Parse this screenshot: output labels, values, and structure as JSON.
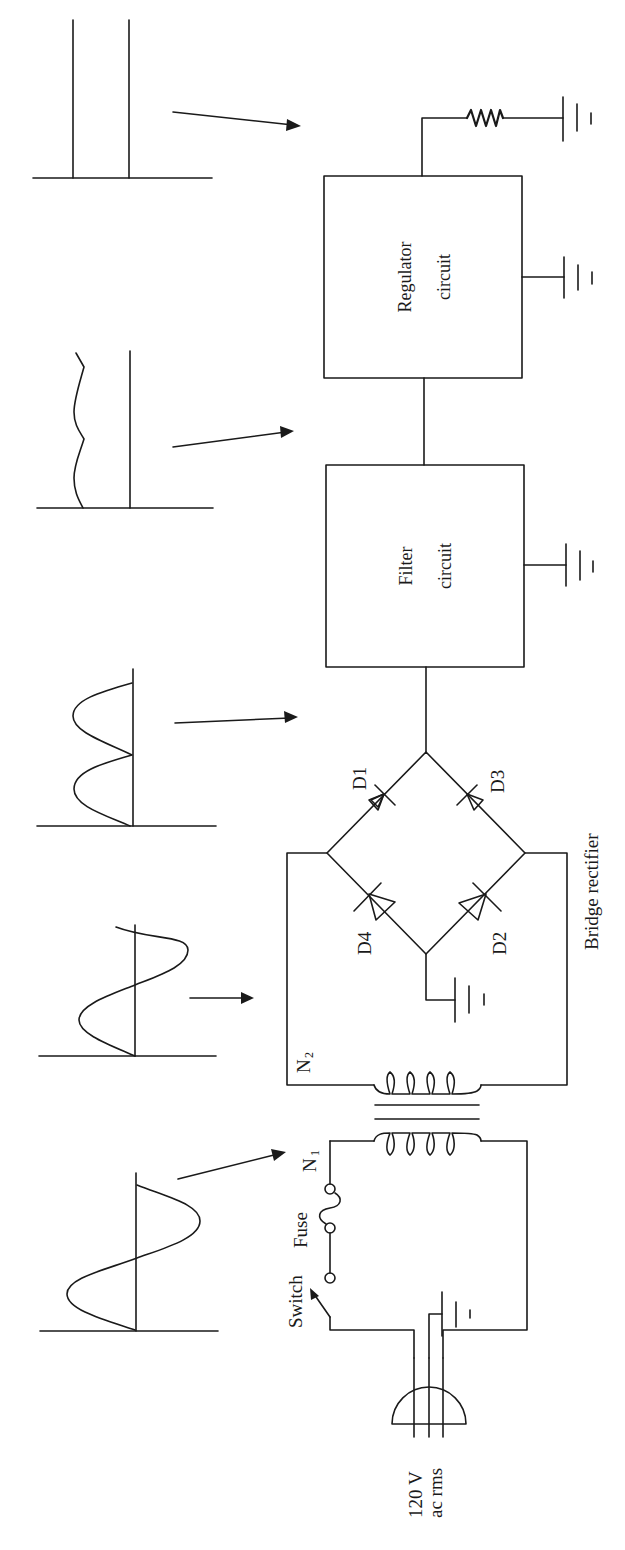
{
  "figure": {
    "orientation": "rotated 90 degrees counter-clockwise",
    "stroke_color": "#1a1a1a",
    "background": "#ffffff"
  },
  "source": {
    "line1": "120 V",
    "line2": "ac rms",
    "icon": "ac-plug-icon"
  },
  "controls": {
    "switch_label": "Switch",
    "fuse_label": "Fuse"
  },
  "transformer": {
    "primary_label": "N",
    "primary_sub": "1",
    "secondary_label": "N",
    "secondary_sub": "2"
  },
  "rectifier": {
    "title": "Bridge rectifier",
    "diodes": [
      {
        "id": "D1"
      },
      {
        "id": "D2"
      },
      {
        "id": "D3"
      },
      {
        "id": "D4"
      }
    ]
  },
  "blocks": [
    {
      "id": "filter",
      "line1": "Filter",
      "line2": "circuit"
    },
    {
      "id": "regulator",
      "line1": "Regulator",
      "line2": "circuit"
    }
  ],
  "load": {
    "icon": "resistor-icon"
  },
  "waveforms": [
    {
      "stage": "transformer-primary",
      "shape": "sine (large amplitude)"
    },
    {
      "stage": "transformer-secondary",
      "shape": "sine (reduced amplitude)"
    },
    {
      "stage": "rectifier-output",
      "shape": "full-wave rectified"
    },
    {
      "stage": "filter-output",
      "shape": "dc with ripple"
    },
    {
      "stage": "regulator-output",
      "shape": "steady dc"
    }
  ],
  "grounds": [
    "source-ground",
    "rectifier-ground",
    "filter-ground",
    "regulator-ground",
    "load-ground"
  ]
}
